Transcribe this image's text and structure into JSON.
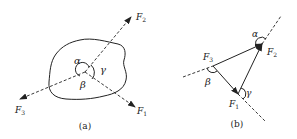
{
  "figure_a": {
    "caption": "(a)",
    "forces": [
      {
        "name": "F",
        "sub": "1"
      },
      {
        "name": "F",
        "sub": "2"
      },
      {
        "name": "F",
        "sub": "3"
      }
    ],
    "angles": {
      "alpha": "α",
      "beta": "β",
      "gamma": "γ"
    }
  },
  "figure_b": {
    "caption": "(b)",
    "forces": [
      {
        "name": "F",
        "sub": "1"
      },
      {
        "name": "F",
        "sub": "2"
      },
      {
        "name": "F",
        "sub": "3"
      }
    ],
    "angles": {
      "alpha": "α",
      "beta": "β",
      "gamma": "γ"
    }
  },
  "colors": {
    "stroke": "#222222",
    "background": "#ffffff"
  }
}
